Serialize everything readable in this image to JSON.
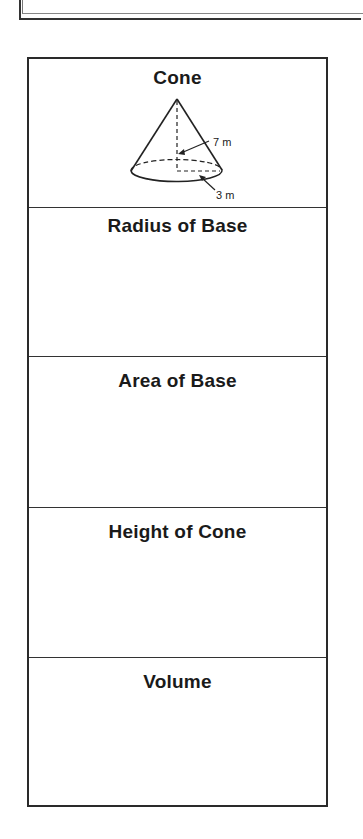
{
  "worksheet": {
    "shape_title": "Cone",
    "diagram": {
      "height_label": "7 m",
      "radius_label": "3 m"
    },
    "sections": [
      {
        "title": "Radius of Base",
        "answer": ""
      },
      {
        "title": "Area of Base",
        "answer": ""
      },
      {
        "title": "Height of Cone",
        "answer": ""
      },
      {
        "title": "Volume",
        "answer": ""
      }
    ]
  }
}
